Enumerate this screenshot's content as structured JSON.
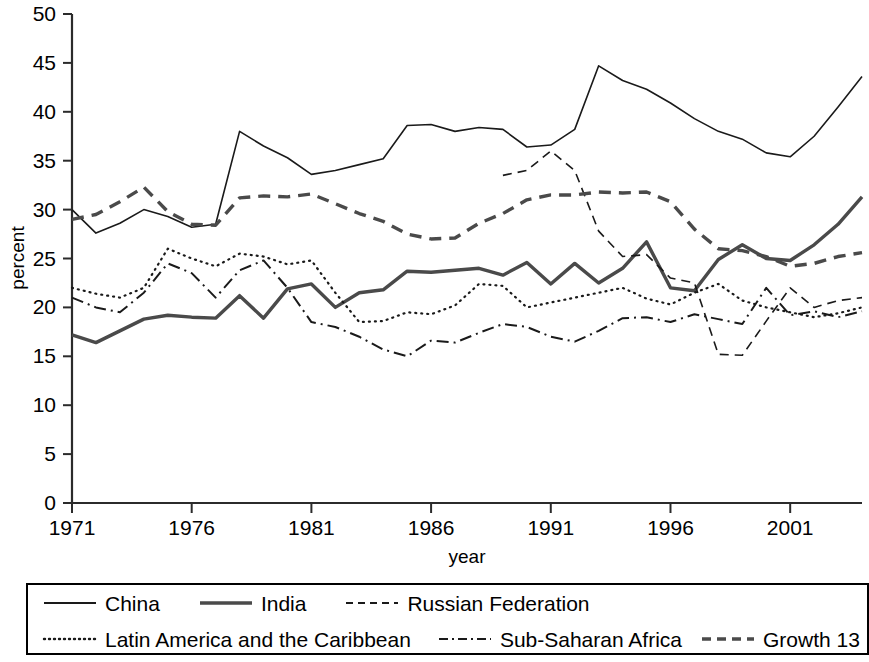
{
  "chart_data": {
    "type": "line",
    "title": "",
    "xlabel": "year",
    "ylabel": "percent",
    "xlim": [
      1971,
      2004
    ],
    "ylim": [
      0,
      50
    ],
    "ytick_step": 5,
    "xticks": [
      1971,
      1976,
      1981,
      1986,
      1991,
      1996,
      2001
    ],
    "ytick_labels": [
      "0",
      "5",
      "10",
      "15",
      "20",
      "25",
      "30",
      "35",
      "40",
      "45",
      "50"
    ],
    "grid": false,
    "legend_position": "below-plot",
    "series": [
      {
        "name": "China",
        "style": "solid",
        "width": 1.6,
        "color": "#1a1a1a",
        "x": [
          1971,
          1972,
          1973,
          1974,
          1975,
          1976,
          1977,
          1978,
          1979,
          1980,
          1981,
          1982,
          1983,
          1984,
          1985,
          1986,
          1987,
          1988,
          1989,
          1990,
          1991,
          1992,
          1993,
          1994,
          1995,
          1996,
          1997,
          1998,
          1999,
          2000,
          2001,
          2002,
          2003,
          2004
        ],
        "values": [
          30.0,
          27.6,
          28.6,
          30.0,
          29.3,
          28.2,
          28.5,
          38.0,
          36.5,
          35.3,
          33.6,
          34.0,
          34.6,
          35.2,
          38.6,
          38.7,
          38.0,
          38.4,
          38.2,
          36.4,
          36.6,
          38.2,
          44.7,
          43.2,
          42.3,
          40.9,
          39.3,
          38.0,
          37.2,
          35.8,
          35.4,
          37.5,
          40.5,
          43.6
        ]
      },
      {
        "name": "India",
        "style": "solid",
        "width": 3.4,
        "color": "#4a4a4a",
        "x": [
          1971,
          1972,
          1973,
          1974,
          1975,
          1976,
          1977,
          1978,
          1979,
          1980,
          1981,
          1982,
          1983,
          1984,
          1985,
          1986,
          1987,
          1988,
          1989,
          1990,
          1991,
          1992,
          1993,
          1994,
          1995,
          1996,
          1997,
          1998,
          1999,
          2000,
          2001,
          2002,
          2003,
          2004
        ],
        "values": [
          17.2,
          16.4,
          17.6,
          18.8,
          19.2,
          19.0,
          18.9,
          21.2,
          18.9,
          21.9,
          22.4,
          20.0,
          21.5,
          21.8,
          23.7,
          23.6,
          23.8,
          24.0,
          23.3,
          24.6,
          22.4,
          24.5,
          22.5,
          24.0,
          26.7,
          22.0,
          21.7,
          24.9,
          26.4,
          25.0,
          24.8,
          26.4,
          28.5,
          31.3
        ]
      },
      {
        "name": "Russian Federation",
        "style": "dashed-thin",
        "width": 1.6,
        "color": "#1a1a1a",
        "x": [
          1989,
          1990,
          1991,
          1992,
          1993,
          1994,
          1995,
          1996,
          1997,
          1998,
          1999,
          2000,
          2001,
          2002,
          2003,
          2004
        ],
        "values": [
          33.5,
          34.0,
          36.0,
          34.0,
          27.8,
          25.2,
          25.4,
          23.0,
          22.5,
          15.2,
          15.1,
          18.6,
          22.0,
          20.0,
          20.7,
          21.0
        ]
      },
      {
        "name": "Latin America and the Caribbean",
        "style": "dotted",
        "width": 2.2,
        "color": "#1a1a1a",
        "x": [
          1971,
          1972,
          1973,
          1974,
          1975,
          1976,
          1977,
          1978,
          1979,
          1980,
          1981,
          1982,
          1983,
          1984,
          1985,
          1986,
          1987,
          1988,
          1989,
          1990,
          1991,
          1992,
          1993,
          1994,
          1995,
          1996,
          1997,
          1998,
          1999,
          2000,
          2001,
          2002,
          2003,
          2004
        ],
        "values": [
          22.0,
          21.4,
          21.0,
          22.0,
          26.0,
          25.0,
          24.2,
          25.5,
          25.2,
          24.4,
          24.8,
          21.5,
          18.5,
          18.6,
          19.5,
          19.3,
          20.2,
          22.4,
          22.2,
          20.0,
          20.5,
          21.0,
          21.5,
          22.0,
          20.9,
          20.3,
          21.5,
          22.4,
          20.7,
          20.0,
          19.5,
          19.0,
          19.4,
          20.0
        ]
      },
      {
        "name": "Sub-Saharan Africa",
        "style": "dashdot",
        "width": 2.0,
        "color": "#1a1a1a",
        "x": [
          1971,
          1972,
          1973,
          1974,
          1975,
          1976,
          1977,
          1978,
          1979,
          1980,
          1981,
          1982,
          1983,
          1984,
          1985,
          1986,
          1987,
          1988,
          1989,
          1990,
          1991,
          1992,
          1993,
          1994,
          1995,
          1996,
          1997,
          1998,
          1999,
          2000,
          2001,
          2002,
          2003,
          2004
        ],
        "values": [
          21.0,
          20.0,
          19.5,
          21.5,
          24.5,
          23.5,
          21.0,
          23.8,
          24.8,
          22.0,
          18.5,
          18.0,
          17.0,
          15.7,
          15.0,
          16.6,
          16.4,
          17.4,
          18.3,
          18.0,
          17.0,
          16.5,
          17.6,
          18.9,
          19.0,
          18.5,
          19.3,
          18.8,
          18.3,
          22.0,
          19.2,
          19.6,
          19.0,
          19.6
        ]
      },
      {
        "name": "Growth 13",
        "style": "dashed-thick",
        "width": 3.4,
        "color": "#4a4a4a",
        "x": [
          1971,
          1972,
          1973,
          1974,
          1975,
          1976,
          1977,
          1978,
          1979,
          1980,
          1981,
          1982,
          1983,
          1984,
          1985,
          1986,
          1987,
          1988,
          1989,
          1990,
          1991,
          1992,
          1993,
          1994,
          1995,
          1996,
          1997,
          1998,
          1999,
          2000,
          2001,
          2002,
          2003,
          2004
        ],
        "values": [
          29.0,
          29.5,
          30.8,
          32.3,
          29.8,
          28.5,
          28.4,
          31.2,
          31.4,
          31.3,
          31.6,
          30.6,
          29.6,
          28.8,
          27.5,
          27.0,
          27.1,
          28.6,
          29.6,
          31.0,
          31.5,
          31.5,
          31.8,
          31.7,
          31.8,
          30.8,
          28.0,
          26.0,
          25.8,
          25.2,
          24.2,
          24.5,
          25.2,
          25.6
        ]
      }
    ]
  },
  "axes": {
    "ylabel": "percent",
    "xlabel": "year"
  },
  "legend": {
    "rows": [
      [
        {
          "label": "China",
          "swatch": "solid-thin"
        },
        {
          "label": "India",
          "swatch": "solid-thick"
        },
        {
          "label": "Russian Federation",
          "swatch": "dashed-thin"
        }
      ],
      [
        {
          "label": "Latin America and the Caribbean",
          "swatch": "dotted"
        },
        {
          "label": "Sub-Saharan Africa",
          "swatch": "dashdot"
        },
        {
          "label": "Growth 13",
          "swatch": "dashed-thick"
        }
      ]
    ]
  }
}
